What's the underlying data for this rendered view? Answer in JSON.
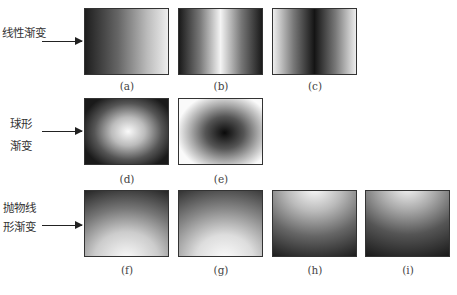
{
  "rows": [
    {
      "label_lines": [
        "线性渐变"
      ],
      "category": "linear-gradient",
      "panels": [
        {
          "id": "a",
          "caption": "(a)",
          "description": "horizontal linear gradient, dark left to light right"
        },
        {
          "id": "b",
          "caption": "(b)",
          "description": "symmetric linear gradient, dark edges, light center"
        },
        {
          "id": "c",
          "caption": "(c)",
          "description": "symmetric linear gradient, light edges, dark center"
        }
      ]
    },
    {
      "label_lines": [
        "球形",
        "渐变"
      ],
      "category": "spherical-gradient",
      "panels": [
        {
          "id": "d",
          "caption": "(d)",
          "description": "radial gradient, light center, dark edges"
        },
        {
          "id": "e",
          "caption": "(e)",
          "description": "radial gradient, dark center, light edges"
        }
      ]
    },
    {
      "label_lines": [
        "抛物线",
        "形渐变"
      ],
      "category": "parabolic-gradient",
      "panels": [
        {
          "id": "f",
          "caption": "(f)",
          "description": "parabolic gradient, dark top to light bottom"
        },
        {
          "id": "g",
          "caption": "(g)",
          "description": "parabolic gradient, dark top to light bottom (softer)"
        },
        {
          "id": "h",
          "caption": "(h)",
          "description": "parabolic gradient, light top to dark bottom"
        },
        {
          "id": "i",
          "caption": "(i)",
          "description": "parabolic gradient, light top to dark bottom (stronger)"
        }
      ]
    }
  ],
  "colors": {
    "border": "#333333",
    "dark": "#1a1a1a",
    "light": "#f8f8f8"
  }
}
